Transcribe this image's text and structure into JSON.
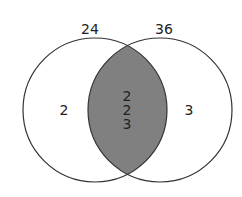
{
  "diagram": {
    "type": "venn",
    "sets": [
      {
        "label": "24",
        "exclusive_factors": [
          "2"
        ]
      },
      {
        "label": "36",
        "exclusive_factors": [
          "3"
        ]
      }
    ],
    "intersection": {
      "factors": [
        "2",
        "2",
        "3"
      ],
      "fill": "#808080"
    },
    "colors": {
      "stroke": "#333333",
      "background": "#ffffff",
      "shaded": "#808080"
    }
  }
}
